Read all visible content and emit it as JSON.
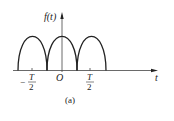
{
  "figure": {
    "y_axis_label": "f(t)",
    "x_axis_label": "t",
    "origin_label": "O",
    "tick_left": {
      "sign": "−",
      "num": "T",
      "den": "2"
    },
    "tick_right": {
      "num": "T",
      "den": "2"
    },
    "caption": "(a)",
    "colors": {
      "line": "#222222",
      "axis": "#333333",
      "background": "#ffffff"
    }
  }
}
